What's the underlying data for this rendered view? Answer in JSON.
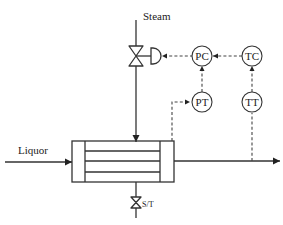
{
  "diagram": {
    "streams": {
      "steam": "Steam",
      "liquor": "Liquor",
      "steam_trap": "S/T"
    },
    "instruments": {
      "pc": "PC",
      "tc": "TC",
      "pt": "PT",
      "tt": "TT"
    },
    "colors": {
      "line": "#333333",
      "background": "#ffffff"
    }
  }
}
